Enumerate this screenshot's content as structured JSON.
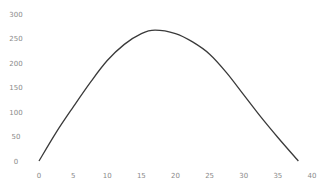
{
  "chart_data": {
    "type": "line",
    "title": "",
    "xlabel": "",
    "ylabel": "",
    "xlim": [
      0,
      40
    ],
    "ylim": [
      0,
      300
    ],
    "grid": false,
    "legend": null,
    "x_ticks": [
      "0",
      "5",
      "10",
      "15",
      "20",
      "25",
      "30",
      "35",
      "40"
    ],
    "y_ticks": [
      "300",
      "250",
      "200",
      "150",
      "100",
      "50",
      "0"
    ],
    "series": [
      {
        "name": "",
        "color": "#3a3a3a",
        "x": [
          0,
          2.5,
          5,
          7.5,
          10,
          12.5,
          15,
          17,
          20,
          22.5,
          25,
          27.5,
          30,
          32.5,
          35,
          38
        ],
        "y": [
          0,
          58,
          110,
          160,
          205,
          238,
          260,
          267,
          260,
          243,
          218,
          180,
          135,
          90,
          48,
          0
        ]
      }
    ]
  }
}
